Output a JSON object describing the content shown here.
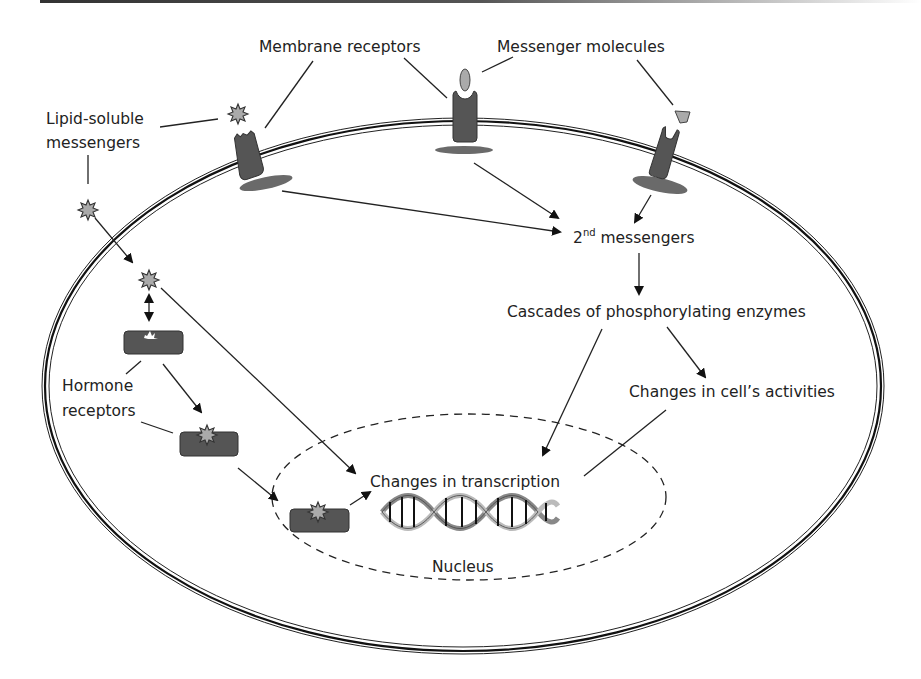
{
  "diagram": {
    "title_bar": "",
    "labels": {
      "membrane_receptors": "Membrane receptors",
      "messenger_molecules": "Messenger molecules",
      "lipid_soluble_line1": "Lipid-soluble",
      "lipid_soluble_line2": "messengers",
      "second_messengers_num": "2",
      "second_messengers_sup": "nd",
      "second_messengers_text": " messengers",
      "cascades": "Cascades of phosphorylating enzymes",
      "cell_activities": "Changes in cell’s activities",
      "hormone_line1": "Hormone",
      "hormone_line2": "receptors",
      "transcription": "Changes in transcription",
      "nucleus": "Nucleus"
    },
    "colors": {
      "receptor": "#555555",
      "messenger_fill": "#aaaaaa",
      "line": "#222222",
      "background": "#ffffff"
    },
    "nodes": [
      "Membrane receptors",
      "Messenger molecules",
      "Lipid-soluble messengers",
      "2nd messengers",
      "Cascades of phosphorylating enzymes",
      "Changes in cell’s activities",
      "Hormone receptors",
      "Changes in transcription",
      "Nucleus"
    ],
    "edges": [
      [
        "Membrane receptor (left)",
        "2nd messengers"
      ],
      [
        "Membrane receptor (middle)",
        "2nd messengers"
      ],
      [
        "Membrane receptor (right)",
        "2nd messengers"
      ],
      [
        "2nd messengers",
        "Cascades of phosphorylating enzymes"
      ],
      [
        "Cascades of phosphorylating enzymes",
        "Changes in cell’s activities"
      ],
      [
        "Cascades of phosphorylating enzymes",
        "Changes in transcription"
      ],
      [
        "Changes in cell’s activities",
        "Changes in transcription"
      ],
      [
        "Lipid-soluble messenger",
        "Cytoplasmic messenger"
      ],
      [
        "Cytoplasmic messenger",
        "Hormone receptor (bound)"
      ],
      [
        "Cytoplasmic messenger",
        "Changes in transcription"
      ],
      [
        "Hormone receptor",
        "Hormone receptor with messenger"
      ],
      [
        "Hormone receptor with messenger",
        "Nuclear receptor complex"
      ],
      [
        "Nuclear receptor complex",
        "Changes in transcription"
      ]
    ]
  }
}
